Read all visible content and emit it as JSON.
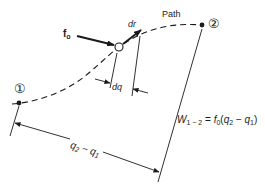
{
  "diagram": {
    "type": "work along a path diagram",
    "path_label": "Path",
    "point_1_label": "①",
    "point_2_label": "②",
    "force_label": "f",
    "force_subscript": "o",
    "displacement_label": "dr",
    "dq_label": "dq",
    "distance_label": "q",
    "distance_sub_2": "2",
    "distance_minus": " − ",
    "distance_sub_1": "1",
    "distance_q2": "q",
    "distance_q1": "q",
    "work_formula": {
      "lhs": "W",
      "lhs_sub": "1 − 2",
      "eq": " = ",
      "f": "f",
      "f_sub": "0",
      "open": "(",
      "q2": "q",
      "q2_sub": "2",
      "minus": " − ",
      "q1": "q",
      "q1_sub": "1",
      "close": ")"
    },
    "colors": {
      "ink": "#1a1a1a",
      "background": "#ffffff"
    }
  }
}
